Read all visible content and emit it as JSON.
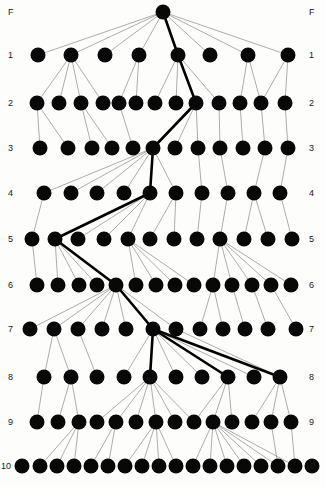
{
  "figure": {
    "background_color": "#fdfdfc",
    "node_color": "#080808",
    "edge_color": "#8a8a8a",
    "highlight_color": "#000000",
    "label_color": "#1a1a1a",
    "width": 325,
    "height": 487
  },
  "labels": {
    "left": [
      "F",
      "1",
      "2",
      "3",
      "4",
      "5",
      "6",
      "7",
      "8",
      "9",
      "10"
    ],
    "right": [
      "F",
      "1",
      "2",
      "3",
      "4",
      "5",
      "6",
      "7",
      "8",
      "9",
      "10"
    ]
  },
  "chart_data": {
    "type": "diagram",
    "subtype": "tree",
    "xlabel": "",
    "ylabel": "",
    "legend": [],
    "grid": false,
    "levels": [
      {
        "name": "F",
        "y": 12,
        "count": 1,
        "x": [
          163
        ]
      },
      {
        "name": "1",
        "y": 55,
        "count": 8,
        "x": [
          38,
          71,
          105,
          139,
          178,
          210,
          248,
          288
        ]
      },
      {
        "name": "2",
        "y": 103,
        "count": 13,
        "x": [
          37,
          59,
          81,
          103,
          119,
          136,
          155,
          176,
          196,
          219,
          240,
          261,
          285
        ]
      },
      {
        "name": "3",
        "y": 148,
        "count": 11,
        "x": [
          40,
          68,
          92,
          112,
          133,
          153,
          175,
          198,
          220,
          243,
          265,
          288
        ]
      },
      {
        "name": "4",
        "y": 193,
        "count": 10,
        "x": [
          44,
          71,
          97,
          124,
          150,
          176,
          202,
          228,
          254,
          280
        ]
      },
      {
        "name": "5",
        "y": 239,
        "count": 12,
        "x": [
          32,
          55,
          78,
          104,
          128,
          150,
          174,
          197,
          220,
          244,
          268,
          292
        ]
      },
      {
        "name": "6",
        "y": 285,
        "count": 14,
        "x": [
          37,
          58,
          79,
          97,
          116,
          136,
          156,
          175,
          194,
          213,
          232,
          252,
          271,
          291
        ]
      },
      {
        "name": "7",
        "y": 329,
        "count": 12,
        "x": [
          30,
          54,
          78,
          102,
          126,
          153,
          176,
          200,
          223,
          245,
          268,
          296
        ]
      },
      {
        "name": "8",
        "y": 377,
        "count": 10,
        "x": [
          44,
          71,
          97,
          124,
          150,
          176,
          202,
          228,
          254,
          280
        ]
      },
      {
        "name": "9",
        "y": 422,
        "count": 14,
        "x": [
          37,
          58,
          79,
          97,
          116,
          136,
          156,
          175,
          194,
          213,
          232,
          252,
          271,
          291
        ]
      },
      {
        "name": "10",
        "y": 466,
        "count": 18,
        "x": [
          22,
          40,
          57,
          74,
          91,
          108,
          125,
          142,
          159,
          176,
          193,
          210,
          227,
          244,
          261,
          278,
          295,
          312
        ]
      }
    ],
    "node_radius": 7.5,
    "highlight_path": [
      "F:0",
      "1:4",
      "2:8",
      "3:5",
      "4:4",
      "5:1",
      "6:4",
      "7:5",
      "8:4"
    ],
    "edges": [
      {
        "from": "F:0",
        "to": "1:0"
      },
      {
        "from": "F:0",
        "to": "1:1"
      },
      {
        "from": "F:0",
        "to": "1:2"
      },
      {
        "from": "F:0",
        "to": "1:3"
      },
      {
        "from": "F:0",
        "to": "1:4",
        "bold": true
      },
      {
        "from": "F:0",
        "to": "1:5"
      },
      {
        "from": "F:0",
        "to": "1:6"
      },
      {
        "from": "F:0",
        "to": "1:7"
      },
      {
        "from": "1:1",
        "to": "2:0"
      },
      {
        "from": "1:1",
        "to": "2:1"
      },
      {
        "from": "1:1",
        "to": "2:2"
      },
      {
        "from": "1:1",
        "to": "2:3"
      },
      {
        "from": "1:3",
        "to": "2:4"
      },
      {
        "from": "1:3",
        "to": "2:5"
      },
      {
        "from": "1:4",
        "to": "2:6"
      },
      {
        "from": "1:4",
        "to": "2:7"
      },
      {
        "from": "1:4",
        "to": "2:8",
        "bold": true
      },
      {
        "from": "1:4",
        "to": "2:9"
      },
      {
        "from": "1:6",
        "to": "2:10"
      },
      {
        "from": "1:6",
        "to": "2:11"
      },
      {
        "from": "1:7",
        "to": "2:11"
      },
      {
        "from": "1:7",
        "to": "2:12"
      },
      {
        "from": "2:0",
        "to": "3:0"
      },
      {
        "from": "2:0",
        "to": "3:1"
      },
      {
        "from": "2:2",
        "to": "3:2"
      },
      {
        "from": "2:2",
        "to": "3:3"
      },
      {
        "from": "2:4",
        "to": "3:4"
      },
      {
        "from": "2:8",
        "to": "3:5",
        "bold": true
      },
      {
        "from": "2:8",
        "to": "3:6"
      },
      {
        "from": "2:8",
        "to": "3:7"
      },
      {
        "from": "2:9",
        "to": "3:8"
      },
      {
        "from": "2:10",
        "to": "3:9"
      },
      {
        "from": "2:11",
        "to": "3:10"
      },
      {
        "from": "2:12",
        "to": "3:11"
      },
      {
        "from": "3:5",
        "to": "4:0"
      },
      {
        "from": "3:5",
        "to": "4:1"
      },
      {
        "from": "3:5",
        "to": "4:2"
      },
      {
        "from": "3:5",
        "to": "4:3"
      },
      {
        "from": "3:5",
        "to": "4:4",
        "bold": true
      },
      {
        "from": "3:5",
        "to": "4:5"
      },
      {
        "from": "3:7",
        "to": "4:6"
      },
      {
        "from": "3:8",
        "to": "4:7"
      },
      {
        "from": "3:10",
        "to": "4:8"
      },
      {
        "from": "3:11",
        "to": "4:9"
      },
      {
        "from": "4:0",
        "to": "5:0"
      },
      {
        "from": "4:4",
        "to": "5:1",
        "bold": true
      },
      {
        "from": "4:4",
        "to": "5:2"
      },
      {
        "from": "4:4",
        "to": "5:3"
      },
      {
        "from": "4:4",
        "to": "5:4"
      },
      {
        "from": "4:5",
        "to": "5:5"
      },
      {
        "from": "4:5",
        "to": "5:6"
      },
      {
        "from": "4:6",
        "to": "5:7"
      },
      {
        "from": "4:7",
        "to": "5:8"
      },
      {
        "from": "4:8",
        "to": "5:9"
      },
      {
        "from": "4:8",
        "to": "5:10"
      },
      {
        "from": "4:9",
        "to": "5:11"
      },
      {
        "from": "5:0",
        "to": "6:0"
      },
      {
        "from": "5:1",
        "to": "6:1"
      },
      {
        "from": "5:1",
        "to": "6:2"
      },
      {
        "from": "5:1",
        "to": "6:3"
      },
      {
        "from": "5:1",
        "to": "6:4",
        "bold": true
      },
      {
        "from": "5:4",
        "to": "6:5"
      },
      {
        "from": "5:4",
        "to": "6:6"
      },
      {
        "from": "5:4",
        "to": "6:7"
      },
      {
        "from": "5:4",
        "to": "6:8"
      },
      {
        "from": "5:8",
        "to": "6:9"
      },
      {
        "from": "5:8",
        "to": "6:10"
      },
      {
        "from": "5:8",
        "to": "6:11"
      },
      {
        "from": "5:8",
        "to": "6:12"
      },
      {
        "from": "5:8",
        "to": "6:13"
      },
      {
        "from": "6:4",
        "to": "7:0"
      },
      {
        "from": "6:4",
        "to": "7:1"
      },
      {
        "from": "6:4",
        "to": "7:2"
      },
      {
        "from": "6:4",
        "to": "7:3"
      },
      {
        "from": "6:4",
        "to": "7:4"
      },
      {
        "from": "6:4",
        "to": "7:5",
        "bold": true
      },
      {
        "from": "6:4",
        "to": "7:6"
      },
      {
        "from": "6:9",
        "to": "7:7"
      },
      {
        "from": "6:9",
        "to": "7:8"
      },
      {
        "from": "6:10",
        "to": "7:9"
      },
      {
        "from": "6:11",
        "to": "7:10"
      },
      {
        "from": "6:12",
        "to": "7:11"
      },
      {
        "from": "7:1",
        "to": "8:0"
      },
      {
        "from": "7:1",
        "to": "8:1"
      },
      {
        "from": "7:2",
        "to": "8:2"
      },
      {
        "from": "7:5",
        "to": "8:3"
      },
      {
        "from": "7:5",
        "to": "8:4",
        "bold": true
      },
      {
        "from": "7:5",
        "to": "8:5"
      },
      {
        "from": "7:5",
        "to": "8:6"
      },
      {
        "from": "7:5",
        "to": "8:7",
        "bold": true
      },
      {
        "from": "7:5",
        "to": "8:8"
      },
      {
        "from": "7:5",
        "to": "8:9",
        "bold": true
      },
      {
        "from": "7:6",
        "to": "8:9"
      },
      {
        "from": "8:0",
        "to": "9:0"
      },
      {
        "from": "8:1",
        "to": "9:1"
      },
      {
        "from": "8:1",
        "to": "9:2"
      },
      {
        "from": "8:4",
        "to": "9:3"
      },
      {
        "from": "8:4",
        "to": "9:4"
      },
      {
        "from": "8:4",
        "to": "9:5"
      },
      {
        "from": "8:4",
        "to": "9:6"
      },
      {
        "from": "8:4",
        "to": "9:7"
      },
      {
        "from": "8:4",
        "to": "9:8"
      },
      {
        "from": "8:7",
        "to": "9:8"
      },
      {
        "from": "8:7",
        "to": "9:9"
      },
      {
        "from": "8:7",
        "to": "9:10"
      },
      {
        "from": "8:9",
        "to": "9:11"
      },
      {
        "from": "8:9",
        "to": "9:12"
      },
      {
        "from": "8:9",
        "to": "9:13"
      },
      {
        "from": "9:2",
        "to": "10:1"
      },
      {
        "from": "9:2",
        "to": "10:2"
      },
      {
        "from": "9:2",
        "to": "10:3"
      },
      {
        "from": "9:4",
        "to": "10:4"
      },
      {
        "from": "9:4",
        "to": "10:5"
      },
      {
        "from": "9:6",
        "to": "10:6"
      },
      {
        "from": "9:6",
        "to": "10:7"
      },
      {
        "from": "9:6",
        "to": "10:8"
      },
      {
        "from": "9:6",
        "to": "10:9"
      },
      {
        "from": "9:9",
        "to": "10:10"
      },
      {
        "from": "9:9",
        "to": "10:11"
      },
      {
        "from": "9:9",
        "to": "10:12"
      },
      {
        "from": "9:9",
        "to": "10:13"
      },
      {
        "from": "9:9",
        "to": "10:14"
      },
      {
        "from": "9:9",
        "to": "10:15"
      },
      {
        "from": "9:9",
        "to": "10:16"
      },
      {
        "from": "9:12",
        "to": "10:15"
      },
      {
        "from": "9:13",
        "to": "10:16"
      }
    ]
  }
}
